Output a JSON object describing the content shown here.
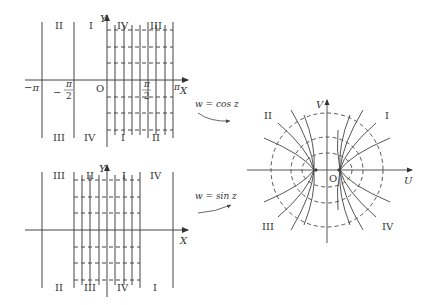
{
  "panels": {
    "top_left": {
      "axis_x": "X",
      "axis_y": "Y",
      "origin": "O",
      "ticks": {
        "neg_pi": "−π",
        "neg_half_pi_num": "π",
        "neg_half_pi_den": "2",
        "half_pi_num": "π",
        "half_pi_den": "2",
        "pi": "π"
      },
      "regions_top": [
        "II",
        "I",
        "IV",
        "III"
      ],
      "regions_bottom": [
        "III",
        "IV",
        "I",
        "II"
      ]
    },
    "bottom_left": {
      "axis_x": "X",
      "axis_y": "Y",
      "regions_top": [
        "III",
        "II",
        "I",
        "IV"
      ],
      "regions_bottom": [
        "II",
        "III",
        "IV",
        "I"
      ]
    },
    "right": {
      "axis_u": "U",
      "axis_v": "V",
      "origin": "O",
      "quadrants": [
        "I",
        "II",
        "III",
        "IV"
      ]
    }
  },
  "mappings": {
    "cos": "w = cos z",
    "sin": "w = sin z"
  },
  "colors": {
    "line": "#444444",
    "text": "#333333",
    "background": "#ffffff"
  }
}
